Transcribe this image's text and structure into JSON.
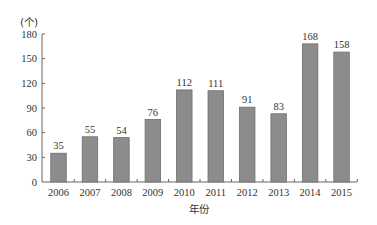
{
  "chart_data": {
    "type": "bar",
    "title": "",
    "xlabel": "年份",
    "ylabel": "(个)",
    "categories": [
      "2006",
      "2007",
      "2008",
      "2009",
      "2010",
      "2011",
      "2012",
      "2013",
      "2014",
      "2015"
    ],
    "values": [
      35,
      55,
      54,
      76,
      112,
      111,
      91,
      83,
      168,
      158
    ],
    "data_labels": [
      "35",
      "55",
      "54",
      "76",
      "112",
      "111",
      "91",
      "83",
      "168",
      "158"
    ],
    "ylim": [
      0,
      180
    ],
    "yticks": [
      0,
      30,
      60,
      90,
      120,
      150,
      180
    ],
    "ytick_labels": [
      "0",
      "30",
      "60",
      "90",
      "120",
      "150",
      "180"
    ],
    "grid": false,
    "legend": null,
    "colors": {
      "bar": "#8c8c8c",
      "bar_edge": "#6e6e6e",
      "axis": "#666666"
    }
  }
}
